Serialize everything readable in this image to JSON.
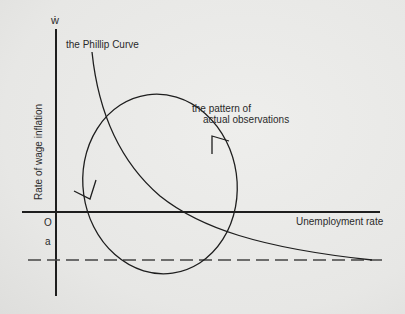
{
  "diagram": {
    "y_axis_symbol": "ẇ",
    "y_axis_label": "Rate of wage inflation",
    "x_axis_label": "Unemployment rate",
    "origin_label": "O",
    "dashed_line_label": "a",
    "curve_label": "the Phillip Curve",
    "loop_label_line1": "the pattern of",
    "loop_label_line2": "actual observations",
    "colors": {
      "ink": "#1e1e1e",
      "background": "#e9e9e7"
    }
  }
}
